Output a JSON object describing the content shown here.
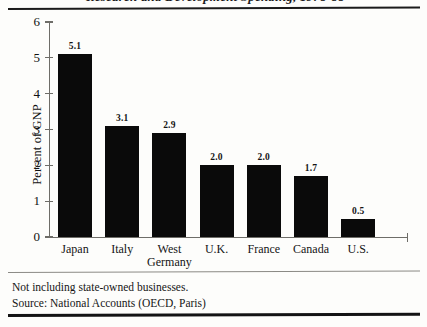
{
  "figure": {
    "title_partial": "Research and Development Spending, 1978-88",
    "footnotes": [
      "Not including state-owned businesses.",
      "Source: National Accounts (OECD, Paris)"
    ]
  },
  "chart_data": {
    "type": "bar",
    "title": "",
    "xlabel": "",
    "ylabel": "Percent of GNP",
    "categories": [
      "Japan",
      "Italy",
      "West\nGermany",
      "U.K.",
      "France",
      "Canada",
      "U.S."
    ],
    "category_lines": [
      [
        "Japan"
      ],
      [
        "Italy"
      ],
      [
        "West",
        "Germany"
      ],
      [
        "U.K."
      ],
      [
        "France"
      ],
      [
        "Canada"
      ],
      [
        "U.S."
      ]
    ],
    "values": [
      5.1,
      3.1,
      2.9,
      2.0,
      2.0,
      1.7,
      0.5
    ],
    "value_labels": [
      "5.1",
      "3.1",
      "2.9",
      "2.0",
      "2.0",
      "1.7",
      "0.5"
    ],
    "ylim": [
      0,
      6
    ],
    "yticks": [
      0,
      1,
      2,
      3,
      4,
      5,
      6
    ],
    "ytick_labels": [
      "0",
      "1",
      "2",
      "3",
      "4",
      "5",
      "6"
    ],
    "grid": false,
    "legend": "none",
    "bar_color": "#0a0a0a",
    "axis_color": "#6e6d68",
    "background": "#fdfdfb"
  }
}
